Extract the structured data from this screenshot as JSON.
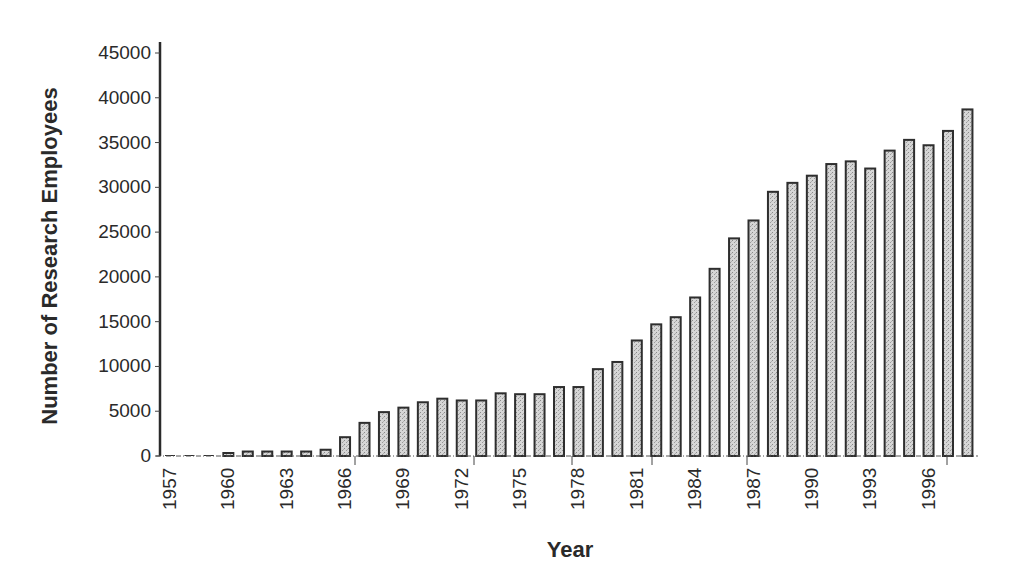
{
  "chart_data": {
    "type": "bar",
    "title": "",
    "xlabel": "Year",
    "ylabel": "Number of Research Employees",
    "ylim": [
      0,
      45000
    ],
    "yticks": [
      0,
      5000,
      10000,
      15000,
      20000,
      25000,
      30000,
      35000,
      40000,
      45000
    ],
    "xtick_labels": [
      "1957",
      "1960",
      "1963",
      "1966",
      "1969",
      "1972",
      "1975",
      "1978",
      "1981",
      "1984",
      "1987",
      "1990",
      "1993",
      "1996"
    ],
    "grid": false,
    "legend": null,
    "categories": [
      "1957",
      "1958",
      "1959",
      "1960",
      "1961",
      "1962",
      "1963",
      "1964",
      "1965",
      "1966",
      "1967",
      "1968",
      "1969",
      "1970",
      "1971",
      "1972",
      "1973",
      "1974",
      "1975",
      "1976",
      "1977",
      "1978",
      "1979",
      "1980",
      "1981",
      "1982",
      "1983",
      "1984",
      "1985",
      "1986",
      "1987",
      "1988",
      "1989",
      "1990",
      "1991",
      "1992",
      "1993",
      "1994",
      "1995",
      "1996",
      "1997",
      "1998"
    ],
    "values": [
      0,
      0,
      0,
      300,
      500,
      500,
      500,
      500,
      700,
      2100,
      3700,
      4900,
      5400,
      6000,
      6400,
      6200,
      6200,
      7000,
      6900,
      6900,
      7700,
      7700,
      9700,
      10500,
      12900,
      14700,
      15500,
      17700,
      20900,
      24300,
      26300,
      29500,
      30500,
      31300,
      32600,
      32900,
      32100,
      34100,
      35300,
      34700,
      36300,
      38700
    ],
    "bar_fill": "#cfcfcf",
    "bar_stroke": "#2e2e2e"
  },
  "axes": {
    "y_title": "Number of Research Employees",
    "x_title": "Year"
  }
}
